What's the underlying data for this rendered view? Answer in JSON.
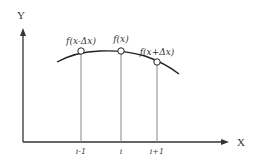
{
  "diagram": {
    "axes": {
      "x_label": "X",
      "y_label": "Y"
    },
    "points": [
      {
        "label": "f(x-Δx)",
        "tick": "i-1"
      },
      {
        "label": "f(x)",
        "tick": "i"
      },
      {
        "label": "f(x+Δx)",
        "tick": "i+1"
      }
    ],
    "colors": {
      "curve": "#222222",
      "axis": "#333333",
      "guide": "#888888",
      "point_fill": "#ffffff"
    }
  }
}
